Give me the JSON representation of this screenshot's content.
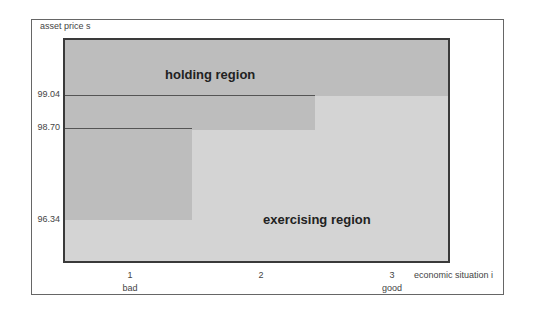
{
  "diagram": {
    "y_axis_label": "asset price s",
    "x_axis_label": "economic situation i",
    "y_ticks": [
      {
        "label": "99.04",
        "value": 99.04
      },
      {
        "label": "98.70",
        "value": 98.7
      },
      {
        "label": "96.34",
        "value": 96.34
      }
    ],
    "x_ticks": [
      {
        "label": "1",
        "sublabel": "bad"
      },
      {
        "label": "2",
        "sublabel": ""
      },
      {
        "label": "3",
        "sublabel": "good"
      }
    ],
    "regions": {
      "holding": "holding region",
      "exercising": "exercising region"
    },
    "thresholds": [
      {
        "state": 1,
        "price": 96.34
      },
      {
        "state": 2,
        "price": 98.7
      },
      {
        "state": 3,
        "price": 99.04
      }
    ],
    "colors": {
      "holding_shade": "#bdbdbd",
      "exercising_shade": "#d4d4d4",
      "border": "#3a3a3a"
    }
  }
}
